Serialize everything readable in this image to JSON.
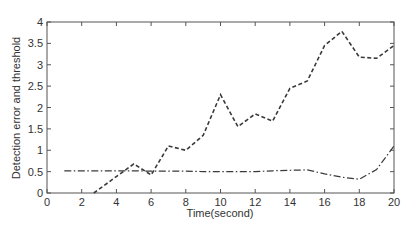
{
  "chart_data": {
    "type": "line",
    "title": "",
    "xlabel": "Time(second)",
    "ylabel": "Detection error and threshold",
    "xlim": [
      0,
      20
    ],
    "ylim": [
      0,
      4
    ],
    "xticks": [
      0,
      2,
      4,
      6,
      8,
      10,
      12,
      14,
      16,
      18,
      20
    ],
    "yticks": [
      0,
      0.5,
      1,
      1.5,
      2,
      2.5,
      3,
      3.5,
      4
    ],
    "grid": false,
    "legend": null,
    "series": [
      {
        "name": "Detection error",
        "style": "dashed",
        "x": [
          2.7,
          5,
          6,
          7,
          8,
          9,
          10,
          11,
          12,
          13,
          14,
          15,
          16,
          17,
          18,
          19,
          20
        ],
        "values": [
          0,
          0.68,
          0.42,
          1.1,
          1.0,
          1.35,
          2.3,
          1.55,
          1.85,
          1.68,
          2.45,
          2.62,
          3.45,
          3.78,
          3.18,
          3.15,
          3.45
        ]
      },
      {
        "name": "Threshold",
        "style": "dash-dot",
        "x": [
          1,
          2,
          3,
          4,
          5,
          6,
          7,
          8,
          9,
          10,
          11,
          12,
          13,
          14,
          15,
          16,
          17,
          18,
          19,
          20
        ],
        "values": [
          0.52,
          0.52,
          0.52,
          0.52,
          0.52,
          0.51,
          0.51,
          0.51,
          0.5,
          0.5,
          0.5,
          0.5,
          0.52,
          0.53,
          0.54,
          0.45,
          0.37,
          0.32,
          0.55,
          1.1
        ]
      }
    ]
  },
  "colors": {
    "line": "#3a3a3a",
    "axis": "#555555"
  }
}
